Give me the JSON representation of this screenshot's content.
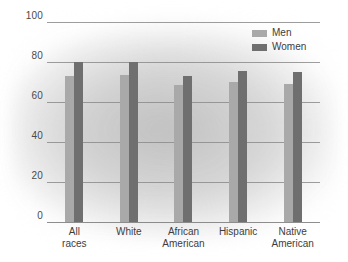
{
  "chart_data": {
    "type": "bar",
    "title": "",
    "subtitle": "",
    "xlabel": "",
    "ylabel": "",
    "ylim": [
      0,
      100
    ],
    "yticks": [
      0,
      20,
      40,
      60,
      80,
      100
    ],
    "grid": true,
    "legend_position": "top-right",
    "categories": [
      "All races",
      "White",
      "African American",
      "Hispanic",
      "Native American"
    ],
    "category_lines": [
      [
        "All",
        "races"
      ],
      [
        "White"
      ],
      [
        "African",
        "American"
      ],
      [
        "Hispanic"
      ],
      [
        "Native",
        "American"
      ]
    ],
    "series": [
      {
        "name": "Men",
        "color": "#a9a9a9",
        "values": [
          73,
          73.5,
          68.5,
          70,
          69
        ]
      },
      {
        "name": "Women",
        "color": "#6f6f6f",
        "values": [
          80,
          80,
          73,
          75.5,
          75
        ]
      }
    ]
  },
  "legend": {
    "items": [
      {
        "label": "Men",
        "swatch": "men"
      },
      {
        "label": "Women",
        "swatch": "women"
      }
    ]
  },
  "colors": {
    "men": "#a9a9a9",
    "women": "#6f6f6f",
    "gridline": "#8c8c8c",
    "text": "#3d3d3d"
  }
}
